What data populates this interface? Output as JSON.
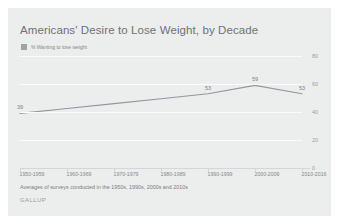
{
  "chart_data": {
    "type": "line",
    "title": "Americans' Desire to Lose Weight, by Decade",
    "xlabel": "",
    "ylabel": "",
    "ylim": [
      0,
      80
    ],
    "yticks": [
      0,
      20,
      40,
      60,
      80
    ],
    "ytick_labels": [
      "0",
      "20",
      "40",
      "60",
      "80"
    ],
    "grid": true,
    "legend_position": "top-left",
    "categories": [
      "1950-1959",
      "1960-1969",
      "1970-1979",
      "1980-1989",
      "1990-1999",
      "2000-2009",
      "2010-2016"
    ],
    "series": [
      {
        "name": "% Wanting to lose weight",
        "color": "#9198a0",
        "values": [
          39,
          null,
          null,
          null,
          53,
          59,
          53
        ],
        "point_labels": [
          "39",
          "",
          "",
          "",
          "53",
          "59",
          "53"
        ]
      }
    ],
    "annotations": {
      "footnote": "Averages of surveys conducted in the 1950s, 1990s, 2000s and 2010s",
      "brand": "GALLUP"
    }
  },
  "card": {
    "background_color": "#eceded",
    "line_color": "#9198a0",
    "gridline_color": "#fbfbfb",
    "title_color": "#6f7276",
    "label_color": "#85888c"
  },
  "legend": {
    "swatch_name": "legend-swatch",
    "label": "% Wanting to lose weight"
  }
}
